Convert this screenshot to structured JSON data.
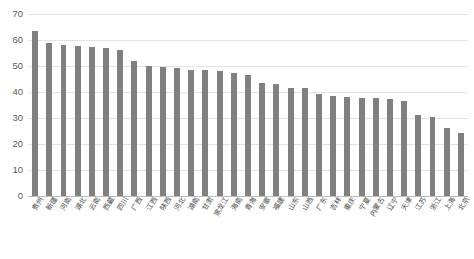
{
  "chart_data": {
    "type": "bar",
    "title": "",
    "subtitle": "",
    "xlabel": "",
    "ylabel": "",
    "ylim": [
      0,
      70
    ],
    "ytick_values": [
      0,
      10,
      20,
      30,
      40,
      50,
      60,
      70
    ],
    "ytick_labels": [
      "0",
      "10",
      "20",
      "30",
      "40",
      "50",
      "60",
      "70"
    ],
    "grid": true,
    "grid_axis": "y",
    "legend": false,
    "legend_position": "none",
    "bar_color": "#808080",
    "grid_color": "#e3e3e3",
    "axis_color": "#bdbdbd",
    "categories": [
      "贵州",
      "新疆",
      "河南",
      "湖北",
      "云南",
      "西藏",
      "四川",
      "广西",
      "江西",
      "陕西",
      "河北",
      "湖南",
      "甘肃",
      "黑龙江",
      "海南",
      "青海",
      "安徽",
      "福建",
      "山东",
      "山西",
      "广东",
      "吉林",
      "重庆",
      "宁夏",
      "内蒙古",
      "辽宁",
      "天津",
      "江苏",
      "浙江",
      "上海",
      "北京"
    ],
    "values": [
      63.5,
      58.8,
      58.2,
      57.8,
      57.4,
      56.8,
      56.1,
      52.0,
      50.0,
      49.5,
      49.3,
      48.6,
      48.6,
      48.2,
      47.4,
      46.6,
      43.5,
      43.0,
      41.7,
      41.4,
      39.1,
      38.4,
      38.2,
      37.8,
      37.6,
      37.5,
      36.6,
      31.1,
      30.5,
      26.1,
      24.1
    ]
  }
}
